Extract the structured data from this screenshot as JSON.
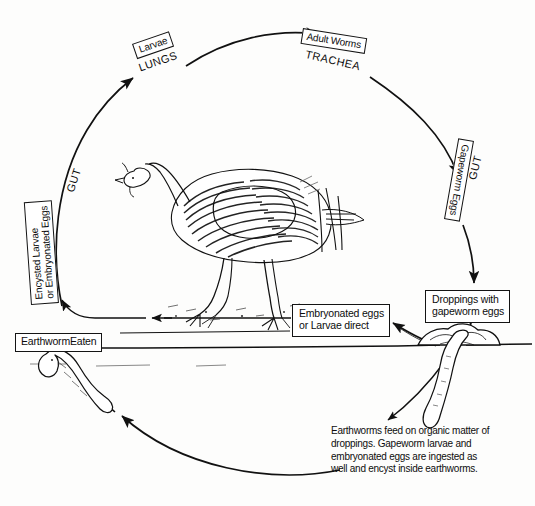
{
  "diagram": {
    "title": "Gapeworm life cycle in turkeys",
    "type": "cycle-diagram",
    "background_color": "#fdfdfc",
    "ink_color": "#111111"
  },
  "stages": {
    "larvae": "Larvae",
    "lungs": "LUNGS",
    "adult_worms": "Adult Worms",
    "trachea": "TRACHEA",
    "gapeworm_eggs": "Gapeworm Eggs",
    "gut_right": "GUT",
    "gut_left": "GUT",
    "encysted": "Encysted Larvae\nor Embryonated Eggs",
    "earthworm_eaten": "EarthwormEaten",
    "embryonated": "Embryonated eggs\nor Larvae direct",
    "droppings": "Droppings with\ngapeworm eggs"
  },
  "caption": {
    "earthworms_note": "Earthworms feed on organic matter of\ndroppings. Gapeworm larvae and\nembryonated eggs are ingested as\nwell and encyst inside earthworms."
  },
  "illustrations": {
    "turkey": "turkey-illustration",
    "earthworm_left": "earthworm-illustration-left",
    "earthworm_right": "earthworm-illustration-right",
    "droppings_mound": "droppings-mound-illustration",
    "ground_line": "ground-line"
  },
  "arrows": {
    "gut_to_lungs": "arc-gut-to-lungs",
    "lungs_to_trachea": "arc-lungs-to-trachea",
    "trachea_to_gut": "arc-trachea-to-gapeworm-eggs",
    "gut_to_droppings": "arrow-gut-to-droppings",
    "droppings_to_ground": "arrow-droppings-to-ground",
    "mound_to_embryonated": "arrow-mound-to-embryonated",
    "embryonated_to_encysted": "arrow-embryonated-to-encysted",
    "caption_to_worm": "arc-caption-to-earthworm",
    "worm_to_caption": "arrow-worm-to-caption"
  }
}
